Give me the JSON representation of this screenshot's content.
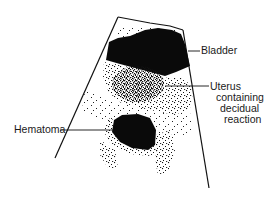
{
  "figure": {
    "type": "ultrasound-illustration",
    "labels": {
      "bladder": "Bladder",
      "uterus_line1": "Uterus",
      "uterus_line2": "containing",
      "uterus_line3": "decidual",
      "uterus_line4": "reaction",
      "hematoma": "Hematoma"
    },
    "colors": {
      "ink": "#0a0a0a",
      "background": "#ffffff",
      "label_text": "#1a1a1a"
    }
  }
}
